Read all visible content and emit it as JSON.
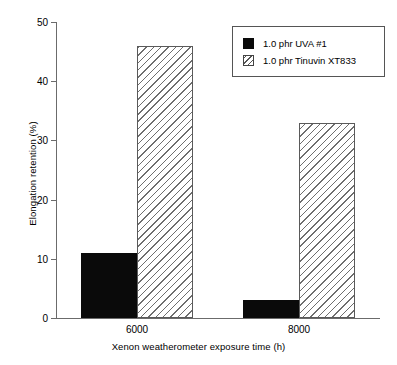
{
  "chart_data": {
    "type": "bar",
    "title": "",
    "subtitle": "",
    "xlabel": "Xenon weatherometer exposure time (h)",
    "ylabel": "Elongation retention (%)",
    "categories": [
      "6000",
      "8000"
    ],
    "series": [
      {
        "name": "1.0 phr UVA #1",
        "values": [
          11,
          3
        ],
        "fill": "solid",
        "color": "#0a0a0a"
      },
      {
        "name": "1.0 phr Tinuvin XT833",
        "values": [
          46,
          33
        ],
        "fill": "hatched",
        "color": "#ffffff"
      }
    ],
    "ylim": [
      0,
      50
    ],
    "yticks": [
      0,
      10,
      20,
      30,
      40,
      50
    ],
    "ytick_labels": [
      "0",
      "10",
      "20",
      "30",
      "40",
      "50"
    ],
    "grid": false,
    "legend_position": "top-right"
  },
  "legend": {
    "entries": [
      {
        "label": "1.0 phr UVA #1"
      },
      {
        "label": "1.0 phr Tinuvin XT833"
      }
    ]
  }
}
